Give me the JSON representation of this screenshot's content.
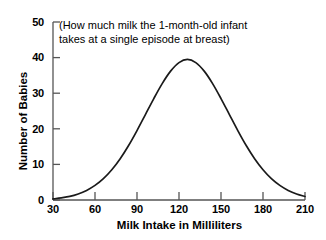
{
  "chart_data": {
    "type": "line",
    "title": "",
    "annotation": "(How much milk the 1-month-old infant takes at a single episode at breast)",
    "annotation_lines": [
      "(How much milk the 1-month-old infant",
      "takes at a single episode at breast)"
    ],
    "xlabel": "Milk Intake in Milliliters",
    "ylabel": "Number of Babies",
    "xlim": [
      30,
      210
    ],
    "ylim": [
      0,
      50
    ],
    "xticks": [
      30,
      60,
      90,
      120,
      150,
      180,
      210
    ],
    "yticks": [
      0,
      10,
      20,
      30,
      40,
      50
    ],
    "xtick_labels": [
      "30",
      "60",
      "90",
      "120",
      "150",
      "180",
      "210"
    ],
    "ytick_labels": [
      "0",
      "10",
      "20",
      "30",
      "40",
      "50"
    ],
    "grid": false,
    "legend": false,
    "curve": {
      "name": "Distribution of milk intake",
      "shape": "normal",
      "mean": 120,
      "sigma": 29,
      "peak": 39.5,
      "x": [
        30,
        36,
        42,
        48,
        54,
        60,
        66,
        72,
        78,
        84,
        90,
        96,
        102,
        108,
        114,
        120,
        126,
        132,
        138,
        144,
        150,
        156,
        162,
        168,
        174,
        180,
        186,
        192,
        198,
        204,
        210
      ],
      "y": [
        0.3,
        0.6,
        1.0,
        1.7,
        2.7,
        4.1,
        6.0,
        8.5,
        11.6,
        15.3,
        19.5,
        24.0,
        28.5,
        32.7,
        36.2,
        38.6,
        39.5,
        38.6,
        36.2,
        32.7,
        28.5,
        24.0,
        19.5,
        15.3,
        11.6,
        8.5,
        6.0,
        4.1,
        2.7,
        1.7,
        1.0
      ]
    },
    "colors": {
      "curve": "#1a1a1a",
      "axis": "#555555",
      "background": "#ffffff",
      "text": "#000000"
    }
  }
}
